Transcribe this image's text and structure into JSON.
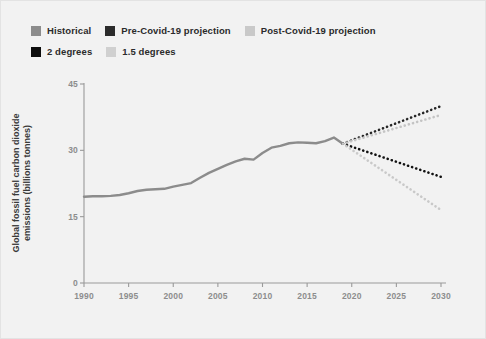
{
  "chart_data": {
    "type": "line",
    "title": "",
    "xlabel": "",
    "ylabel": "Global fossil fuel carbon dioxide emissions (billions tonnes)",
    "xlim": [
      1990,
      2030
    ],
    "ylim": [
      0,
      45
    ],
    "xticks": [
      "1990",
      "1995",
      "2000",
      "2005",
      "2010",
      "2015",
      "2020",
      "2025",
      "2030"
    ],
    "xtick_values": [
      1990,
      1995,
      2000,
      2005,
      2010,
      2015,
      2020,
      2025,
      2030
    ],
    "yticks": [
      "0",
      "15",
      "30",
      "45"
    ],
    "ytick_values": [
      0,
      15,
      30,
      45
    ],
    "grid": false,
    "legend_position": "top-left",
    "series": [
      {
        "name": "Historical",
        "color": "#8c8c8c",
        "style": "solid",
        "x": [
          1990,
          1991,
          1992,
          1993,
          1994,
          1995,
          1996,
          1997,
          1998,
          1999,
          2000,
          2001,
          2002,
          2003,
          2004,
          2005,
          2006,
          2007,
          2008,
          2009,
          2010,
          2011,
          2012,
          2013,
          2014,
          2015,
          2016,
          2017,
          2018,
          2019
        ],
        "values": [
          19.5,
          19.6,
          19.6,
          19.7,
          19.9,
          20.3,
          20.8,
          21.1,
          21.2,
          21.3,
          21.8,
          22.2,
          22.6,
          23.8,
          24.9,
          25.8,
          26.7,
          27.5,
          28.1,
          27.9,
          29.4,
          30.6,
          31.0,
          31.6,
          31.8,
          31.7,
          31.6,
          32.1,
          32.9,
          31.5
        ]
      },
      {
        "name": "Pre-Covid-19 projection",
        "color": "#262626",
        "style": "dotted",
        "x": [
          2019,
          2030
        ],
        "values": [
          31.5,
          40.0
        ]
      },
      {
        "name": "Post-Covid-19 projection",
        "color": "#c4c4c4",
        "style": "dotted",
        "x": [
          2019,
          2030
        ],
        "values": [
          31.5,
          38.0
        ]
      },
      {
        "name": "2 degrees",
        "color": "#111111",
        "style": "dotted",
        "x": [
          2019,
          2030
        ],
        "values": [
          31.5,
          24.0
        ]
      },
      {
        "name": "1.5 degrees",
        "color": "#c9c9c9",
        "style": "dotted",
        "x": [
          2019,
          2030
        ],
        "values": [
          31.5,
          16.5
        ]
      }
    ]
  },
  "legend": {
    "rows": [
      [
        {
          "label": "Historical",
          "color": "#8c8c8c"
        },
        {
          "label": "Pre-Covid-19 projection",
          "color": "#2b2b2b"
        },
        {
          "label": "Post-Covid-19 projection",
          "color": "#c9c9c9"
        }
      ],
      [
        {
          "label": "2 degrees",
          "color": "#0d0d0d"
        },
        {
          "label": "1.5 degrees",
          "color": "#d0d0d0"
        }
      ]
    ]
  },
  "axes": {
    "axis_color": "#9a9a9a",
    "tick_color": "#8d8d8d",
    "background": "#f2f2f2"
  }
}
